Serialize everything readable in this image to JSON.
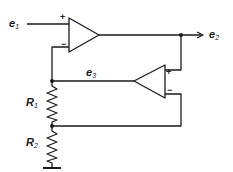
{
  "diagram": {
    "type": "circuit-schematic",
    "labels": {
      "input": {
        "base": "e",
        "sub": "1"
      },
      "output": {
        "base": "e",
        "sub": "2"
      },
      "feedback": {
        "base": "e",
        "sub": "3"
      },
      "r1": {
        "base": "R",
        "sub": "1"
      },
      "r2": {
        "base": "R",
        "sub": "2"
      }
    },
    "opamp1": {
      "plus": "+",
      "minus": "−"
    },
    "opamp2": {
      "plus": "+",
      "minus": "−"
    },
    "line_color": "#1a1a1a"
  }
}
